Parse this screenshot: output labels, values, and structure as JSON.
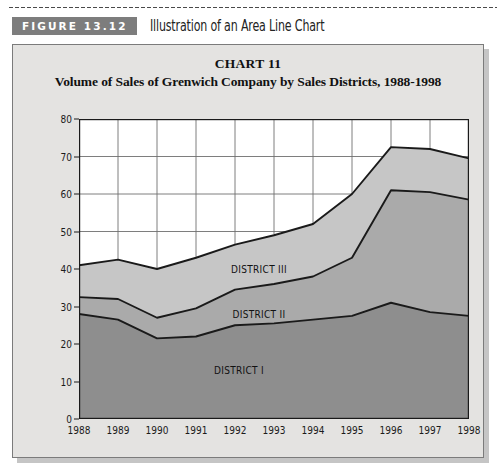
{
  "figure": {
    "tag": "FIGURE 13.12",
    "caption": "Illustration of an Area Line Chart"
  },
  "colors": {
    "panel_background": "#e4e3e1",
    "panel_border": "#7b7b7b",
    "tag_background": "#7d7d7d",
    "plot_background": "#ffffff",
    "district_1_fill": "#8e8e8e",
    "district_2_fill": "#aaaaaa",
    "district_3_fill": "#c6c6c6",
    "line_color": "#1a1a1a",
    "grid_color": "#6f6f6f"
  },
  "chart_data": {
    "type": "area",
    "title": "CHART 11",
    "subtitle": "Volume of Sales of Grenwich Company by Sales Districts, 1988-1998",
    "xlabel": "",
    "ylabel": "$ millions",
    "ylim": [
      0,
      80
    ],
    "yticks": [
      0,
      10,
      20,
      30,
      40,
      50,
      60,
      70,
      80
    ],
    "grid": true,
    "legend": "inline-labels",
    "stacked": true,
    "categories": [
      "1988",
      "1989",
      "1990",
      "1991",
      "1992",
      "1993",
      "1994",
      "1995",
      "1996",
      "1997",
      "1998"
    ],
    "series": [
      {
        "name": "DISTRICT I",
        "label_x": "1992",
        "label_y": 13,
        "values": [
          28.0,
          26.5,
          21.5,
          22.0,
          25.0,
          25.5,
          26.5,
          27.5,
          31.0,
          28.5,
          27.5
        ]
      },
      {
        "name": "DISTRICT II",
        "label_x": "1992",
        "label_y": 28,
        "values": [
          4.5,
          5.5,
          5.5,
          7.5,
          9.5,
          10.5,
          11.5,
          15.5,
          30.0,
          32.0,
          31.0
        ]
      },
      {
        "name": "DISTRICT III",
        "label_x": "1992",
        "label_y": 40,
        "values": [
          8.5,
          10.5,
          13.0,
          13.5,
          12.0,
          13.0,
          14.0,
          17.0,
          11.5,
          11.5,
          11.0
        ]
      }
    ],
    "cumulative_tops": {
      "district_1": [
        28.0,
        26.5,
        21.5,
        22.0,
        25.0,
        25.5,
        26.5,
        27.5,
        31.0,
        28.5,
        27.5
      ],
      "district_2": [
        32.5,
        32.0,
        27.0,
        29.5,
        34.5,
        36.0,
        38.0,
        43.0,
        61.0,
        60.5,
        58.5
      ],
      "district_3": [
        41.0,
        42.5,
        40.0,
        43.0,
        46.5,
        49.0,
        52.0,
        60.0,
        72.5,
        72.0,
        69.5
      ]
    }
  }
}
